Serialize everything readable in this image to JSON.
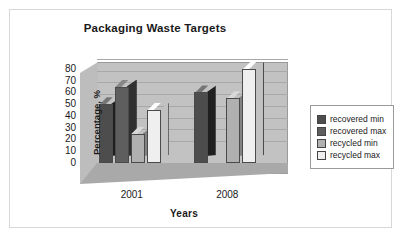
{
  "chart_data": {
    "type": "bar",
    "title": "Packaging Waste Targets",
    "xlabel": "Years",
    "ylabel": "Percentage, %",
    "categories": [
      "2001",
      "2008"
    ],
    "series": [
      {
        "name": "recovered min",
        "values": [
          50,
          60
        ],
        "color": "#4d4d4d"
      },
      {
        "name": "recovered max",
        "values": [
          65,
          0
        ],
        "color": "#5e5e5e"
      },
      {
        "name": "recycled min",
        "values": [
          25,
          55
        ],
        "color": "#b0b0b0"
      },
      {
        "name": "recycled max",
        "values": [
          45,
          80
        ],
        "color": "#efefef"
      }
    ],
    "ylim": [
      0,
      85
    ],
    "yticks": [
      0,
      10,
      20,
      30,
      40,
      50,
      60,
      70,
      80
    ],
    "grid": true,
    "legend_position": "right",
    "style": "3d-column",
    "plot_background": "#c2c2c2",
    "floor_color": "#a9a9a9"
  },
  "legend": {
    "items": [
      {
        "label": "recovered min"
      },
      {
        "label": "recovered max"
      },
      {
        "label": "recycled min"
      },
      {
        "label": "recycled max"
      }
    ]
  }
}
